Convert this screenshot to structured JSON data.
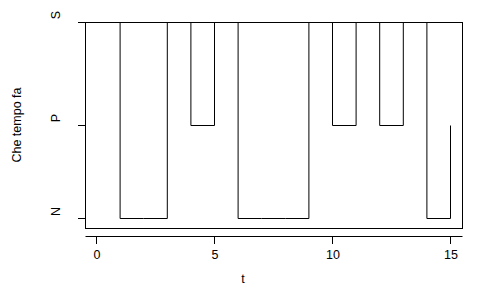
{
  "chart_data": {
    "type": "line",
    "subtype": "step",
    "title": "",
    "xlabel": "t",
    "ylabel": "Che tempo fa",
    "grid": false,
    "legend": null,
    "x": [
      0,
      1,
      2,
      3,
      4,
      5,
      6,
      7,
      8,
      9,
      10,
      11,
      12,
      13,
      14,
      15
    ],
    "values": [
      "S",
      "N",
      "N",
      "S",
      "P",
      "S",
      "N",
      "N",
      "N",
      "S",
      "P",
      "S",
      "P",
      "S",
      "N",
      "P"
    ],
    "y_categories": [
      "N",
      "P",
      "S"
    ],
    "y_levels": {
      "N": 1,
      "P": 2,
      "S": 3
    },
    "numeric_values": [
      3,
      1,
      1,
      3,
      2,
      3,
      1,
      1,
      1,
      3,
      2,
      3,
      2,
      3,
      1,
      2
    ],
    "xlim": [
      -0.46,
      15.4
    ],
    "ylim": [
      1,
      3
    ],
    "xticks": [
      0,
      5,
      10,
      15
    ],
    "xtick_labels": [
      "0",
      "5",
      "10",
      "15"
    ],
    "yticks": [
      1,
      2,
      3
    ],
    "ytick_labels": [
      "N",
      "P",
      "S"
    ],
    "line_color": "#000000",
    "line_width": 1,
    "background": "#ffffff"
  },
  "axis": {
    "x_label": "t",
    "y_label": "Che tempo fa",
    "x_tick_0": "0",
    "x_tick_1": "5",
    "x_tick_2": "10",
    "x_tick_3": "15",
    "y_tick_0": "N",
    "y_tick_1": "P",
    "y_tick_2": "S"
  }
}
